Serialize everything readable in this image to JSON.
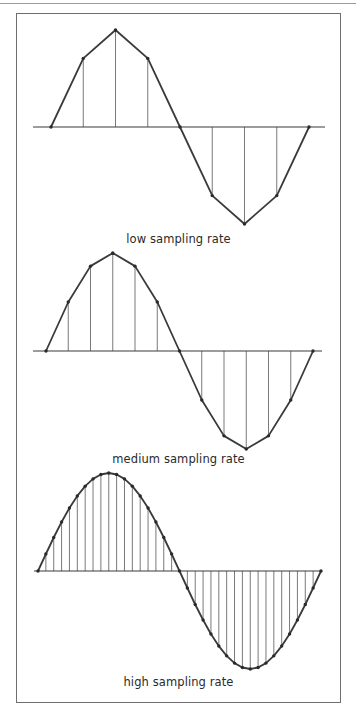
{
  "figure": {
    "colors": {
      "wave": "#3a3a3a",
      "stem": "#7a7a7a",
      "axis": "#3a3a3a",
      "dot": "#2a2a2a"
    },
    "panels": [
      {
        "id": "low",
        "caption": "low sampling rate",
        "caption_y": 232,
        "baseline_y": 127,
        "axis_x": [
          33,
          325
        ],
        "wave_x": [
          51,
          309
        ],
        "amplitude": 97,
        "samples_per_period": 8
      },
      {
        "id": "medium",
        "caption": "medium sampling rate",
        "caption_y": 452,
        "baseline_y": 351,
        "axis_x": [
          33,
          322
        ],
        "wave_x": [
          46,
          313
        ],
        "amplitude": 98,
        "samples_per_period": 12
      },
      {
        "id": "high",
        "caption": "high sampling rate",
        "caption_y": 675,
        "baseline_y": 571,
        "axis_x": [
          34,
          322
        ],
        "wave_x": [
          38,
          321
        ],
        "amplitude": 98,
        "samples_per_period": 36
      }
    ]
  }
}
